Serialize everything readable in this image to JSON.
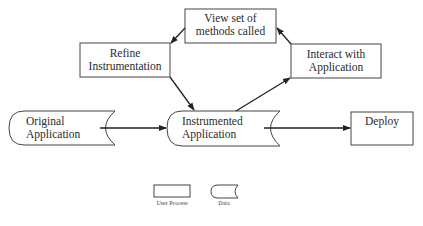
{
  "diagram": {
    "nodes": [
      {
        "id": "view",
        "type": "process",
        "line1": "View set of",
        "line2": "methods called"
      },
      {
        "id": "refine",
        "type": "process",
        "line1": "Refine",
        "line2": "Instrumentation"
      },
      {
        "id": "interact",
        "type": "process",
        "line1": "Interact with",
        "line2": "Application"
      },
      {
        "id": "original",
        "type": "data",
        "line1": "Original",
        "line2": "Application"
      },
      {
        "id": "instrumented",
        "type": "data",
        "line1": "Instrumented",
        "line2": "Application"
      },
      {
        "id": "deploy",
        "type": "process",
        "line1": "Deploy",
        "line2": ""
      }
    ],
    "edges": [
      {
        "from": "original",
        "to": "instrumented"
      },
      {
        "from": "instrumented",
        "to": "interact"
      },
      {
        "from": "interact",
        "to": "view"
      },
      {
        "from": "view",
        "to": "refine"
      },
      {
        "from": "refine",
        "to": "instrumented"
      },
      {
        "from": "instrumented",
        "to": "deploy"
      }
    ]
  },
  "legend": {
    "process_label": "User Process",
    "data_label": "Data"
  },
  "colors": {
    "stroke": "#333333",
    "background": "#ffffff"
  }
}
